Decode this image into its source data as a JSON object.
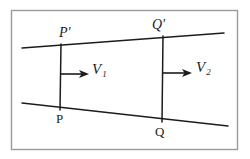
{
  "figure": {
    "background_color": "#ffffff",
    "frame": {
      "name": "figure-border",
      "color": "#9a9a9a",
      "x": 11,
      "y": 10,
      "width": 227,
      "height": 140
    },
    "stroke_color": "#1c1c1c",
    "labels": {
      "p_prime": "P'",
      "q_prime": "Q'",
      "p": "P",
      "q": "Q",
      "v1_symbol": "V",
      "v1_subscript": "1",
      "v2_symbol": "V",
      "v2_subscript": "2"
    },
    "streamlines": [
      {
        "name": "upper-streamline",
        "x1": 22,
        "y1": 48,
        "x2": 224,
        "y2": 33
      },
      {
        "name": "lower-streamline",
        "x1": 22,
        "y1": 103,
        "x2": 228,
        "y2": 126
      }
    ],
    "cross_sections": [
      {
        "name": "cross-section-pp-prime",
        "x1": 61,
        "y1": 44,
        "x2": 60,
        "y2": 110
      },
      {
        "name": "cross-section-qq-prime",
        "x1": 163,
        "y1": 36,
        "x2": 162,
        "y2": 122
      }
    ],
    "vectors": [
      {
        "name": "velocity-vector-1",
        "x1": 61,
        "y1": 74,
        "x2": 88,
        "y2": 74
      },
      {
        "name": "velocity-vector-2",
        "x1": 163,
        "y1": 73,
        "x2": 191,
        "y2": 73
      }
    ]
  }
}
